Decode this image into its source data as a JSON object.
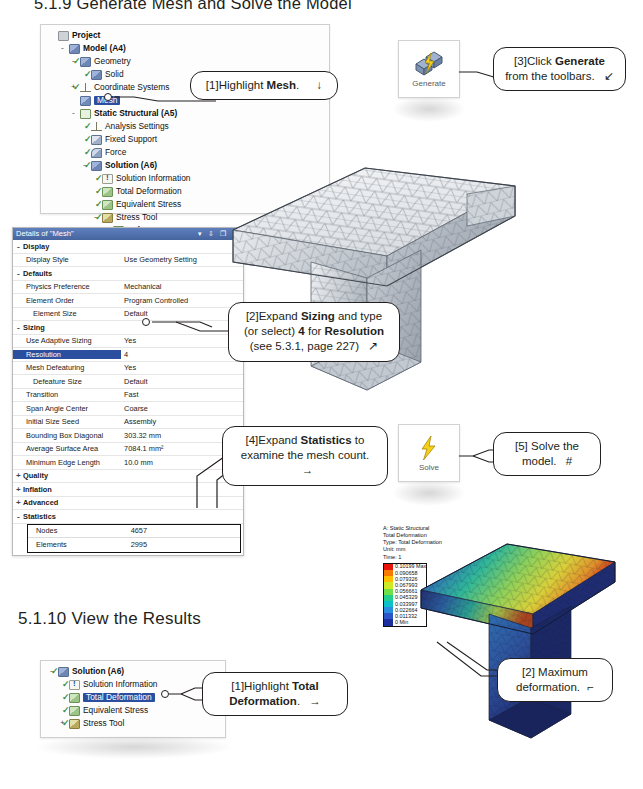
{
  "headings": {
    "top": "5.1.9  Generate Mesh and Solve the Model",
    "results": "5.1.10 View the Results"
  },
  "outline_tree_mesh": {
    "title": "Project Outline",
    "items": [
      {
        "label": "Project",
        "indent": 0,
        "expander": "",
        "bold": true,
        "icon": "project-icon",
        "check": false,
        "selected": false
      },
      {
        "label": "Model (A4)",
        "indent": 1,
        "expander": "-",
        "bold": true,
        "icon": "model-icon",
        "check": false,
        "selected": false
      },
      {
        "label": "Geometry",
        "indent": 2,
        "expander": "-",
        "bold": false,
        "icon": "geometry-icon",
        "check": true,
        "selected": false
      },
      {
        "label": "Solid",
        "indent": 3,
        "expander": "",
        "bold": false,
        "icon": "solid-icon",
        "check": true,
        "selected": false
      },
      {
        "label": "Coordinate Systems",
        "indent": 2,
        "expander": "+",
        "bold": false,
        "icon": "axes-icon",
        "check": true,
        "selected": false
      },
      {
        "label": "Mesh",
        "indent": 2,
        "expander": "",
        "bold": false,
        "icon": "mesh-icon",
        "check": false,
        "selected": true
      },
      {
        "label": "Static Structural (A5)",
        "indent": 2,
        "expander": "-",
        "bold": true,
        "icon": "environment-icon",
        "check": false,
        "selected": false
      },
      {
        "label": "Analysis Settings",
        "indent": 3,
        "expander": "",
        "bold": false,
        "icon": "settings-icon",
        "check": true,
        "selected": false
      },
      {
        "label": "Fixed Support",
        "indent": 3,
        "expander": "",
        "bold": false,
        "icon": "support-icon",
        "check": true,
        "selected": false
      },
      {
        "label": "Force",
        "indent": 3,
        "expander": "",
        "bold": false,
        "icon": "force-icon",
        "check": true,
        "selected": false
      },
      {
        "label": "Solution (A6)",
        "indent": 3,
        "expander": "-",
        "bold": true,
        "icon": "solution-icon",
        "check": true,
        "selected": false
      },
      {
        "label": "Solution Information",
        "indent": 4,
        "expander": "",
        "bold": false,
        "icon": "info-icon",
        "check": true,
        "selected": false
      },
      {
        "label": "Total Deformation",
        "indent": 4,
        "expander": "",
        "bold": false,
        "icon": "result-icon",
        "check": true,
        "selected": false
      },
      {
        "label": "Equivalent Stress",
        "indent": 4,
        "expander": "",
        "bold": false,
        "icon": "result-icon",
        "check": true,
        "selected": false
      },
      {
        "label": "Stress Tool",
        "indent": 4,
        "expander": "-",
        "bold": false,
        "icon": "tool-icon",
        "check": true,
        "selected": false
      },
      {
        "label": "Safety Factor",
        "indent": 5,
        "expander": "",
        "bold": false,
        "icon": "result-icon",
        "check": true,
        "selected": false
      }
    ]
  },
  "outline_tree_results": {
    "items": [
      {
        "label": "Solution (A6)",
        "indent": 0,
        "expander": "-",
        "bold": true,
        "icon": "solution-icon",
        "check": true,
        "selected": false
      },
      {
        "label": "Solution Information",
        "indent": 1,
        "expander": "",
        "bold": false,
        "icon": "info-icon",
        "check": true,
        "selected": false
      },
      {
        "label": "Total Deformation",
        "indent": 1,
        "expander": "",
        "bold": false,
        "icon": "result-icon",
        "check": true,
        "selected": true
      },
      {
        "label": "Equivalent Stress",
        "indent": 1,
        "expander": "",
        "bold": false,
        "icon": "result-icon",
        "check": true,
        "selected": false
      },
      {
        "label": "Stress Tool",
        "indent": 1,
        "expander": "+",
        "bold": false,
        "icon": "tool-icon",
        "check": true,
        "selected": false
      }
    ]
  },
  "details_panel": {
    "title": "Details of \"Mesh\"",
    "window_buttons": "▾ ⇩ ❐ ✕",
    "rows": [
      {
        "type": "group",
        "expander": "-",
        "key": "Display",
        "value": ""
      },
      {
        "type": "item",
        "expander": "",
        "key": "Display Style",
        "value": "Use Geometry Setting"
      },
      {
        "type": "group",
        "expander": "-",
        "key": "Defaults",
        "value": ""
      },
      {
        "type": "item",
        "expander": "",
        "key": "Physics Preference",
        "value": "Mechanical"
      },
      {
        "type": "item",
        "expander": "",
        "key": "Element Order",
        "value": "Program Controlled"
      },
      {
        "type": "item2",
        "expander": "",
        "key": "Element Size",
        "value": "Default"
      },
      {
        "type": "group",
        "expander": "-",
        "key": "Sizing",
        "value": ""
      },
      {
        "type": "item",
        "expander": "",
        "key": "Use Adaptive Sizing",
        "value": "Yes"
      },
      {
        "type": "itemsel",
        "expander": "",
        "key": "Resolution",
        "value": "4"
      },
      {
        "type": "item",
        "expander": "",
        "key": "Mesh Defeaturing",
        "value": "Yes"
      },
      {
        "type": "item2",
        "expander": "",
        "key": "Defeature Size",
        "value": "Default"
      },
      {
        "type": "item",
        "expander": "",
        "key": "Transition",
        "value": "Fast"
      },
      {
        "type": "item",
        "expander": "",
        "key": "Span Angle Center",
        "value": "Coarse"
      },
      {
        "type": "item",
        "expander": "",
        "key": "Initial Size Seed",
        "value": "Assembly"
      },
      {
        "type": "item",
        "expander": "",
        "key": "Bounding Box Diagonal",
        "value": "303.32 mm"
      },
      {
        "type": "item",
        "expander": "",
        "key": "Average Surface Area",
        "value": "7084.1 mm²"
      },
      {
        "type": "item",
        "expander": "",
        "key": "Minimum Edge Length",
        "value": "10.0 mm"
      },
      {
        "type": "group",
        "expander": "+",
        "key": "Quality",
        "value": ""
      },
      {
        "type": "group",
        "expander": "+",
        "key": "Inflation",
        "value": ""
      },
      {
        "type": "group",
        "expander": "+",
        "key": "Advanced",
        "value": ""
      },
      {
        "type": "group",
        "expander": "-",
        "key": "Statistics",
        "value": ""
      }
    ],
    "statistics": [
      {
        "key": "Nodes",
        "value": "4657"
      },
      {
        "key": "Elements",
        "value": "2995"
      }
    ]
  },
  "toolbar_buttons": {
    "generate": {
      "label": "Generate",
      "icon": "generate-mesh-icon"
    },
    "solve": {
      "label": "Solve",
      "icon": "lightning-bolt-icon"
    }
  },
  "callouts": {
    "c1": {
      "number": "[1]",
      "text_before": "Highlight ",
      "emphasis": "Mesh",
      "text_after": ".",
      "arrow": "↓"
    },
    "c2": {
      "number": "[2]",
      "line1_a": "Expand ",
      "line1_em": "Sizing",
      "line1_b": " and type",
      "line2_a": "(or select) ",
      "line2_em": "4",
      "line2_b": " for ",
      "line2_em2": "Resolution",
      "line3": "(see 5.3.1, page 227)",
      "arrow": "↗"
    },
    "c3": {
      "number": "[3]",
      "line1_a": "Click ",
      "line1_em": "Generate",
      "line2": "from the toolbars.",
      "arrow": "↙"
    },
    "c4": {
      "number": "[4]",
      "line1_a": "Expand ",
      "line1_em": "Statistics",
      "line1_b": " to",
      "line2": "examine the mesh count.",
      "arrow": "→"
    },
    "c5": {
      "number": "[5]",
      "line1": "Solve the",
      "line2": "model.",
      "arrow": "#"
    },
    "c6": {
      "number": "[1]",
      "line1_a": "Highlight ",
      "line1_em": "Total",
      "line2_em": "Deformation",
      "line2_b": ".",
      "arrow": "→"
    },
    "c7": {
      "number": "[2]",
      "line1": "Maximum",
      "line2": "deformation.",
      "arrow": "⌐"
    }
  },
  "result_legend": {
    "header_lines": [
      "A: Static Structural",
      "Total Deformation",
      "Type: Total Deformation",
      "Unit: mm",
      "Time: 1"
    ],
    "entries": [
      {
        "value": "0.10199 Max",
        "color": "#e8140c"
      },
      {
        "value": "0.090658",
        "color": "#f77b00"
      },
      {
        "value": "0.079326",
        "color": "#ffbe00"
      },
      {
        "value": "0.067993",
        "color": "#ccea26"
      },
      {
        "value": "0.056661",
        "color": "#6de04a"
      },
      {
        "value": "0.045329",
        "color": "#22d08d"
      },
      {
        "value": "0.033997",
        "color": "#0ec0c9"
      },
      {
        "value": "0.022664",
        "color": "#2a8ee0"
      },
      {
        "value": "0.011332",
        "color": "#2b56c8"
      },
      {
        "value": "0 Min",
        "color": "#1c2f9e"
      }
    ]
  },
  "colors": {
    "selection_blue": "#2b4f9e",
    "panel_title_blue": "#46659f",
    "callout_border": "#231f20",
    "bolt_yellow": "#f2c800"
  }
}
